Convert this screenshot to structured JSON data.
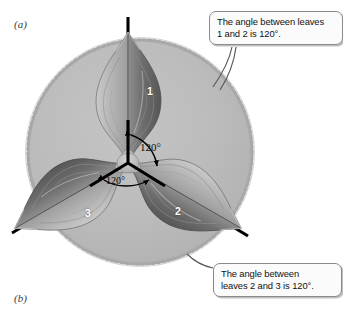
{
  "figure": {
    "panel_a_label": "(a)",
    "panel_b_label": "(b)",
    "background_color": "#ffffff"
  },
  "diagram": {
    "disc_color": "#b8b8b8",
    "axis_color": "#000000",
    "center": {
      "x": 128,
      "y": 163
    },
    "axes": [
      {
        "name": "axis-up",
        "angle_deg": 90,
        "end_x": 128,
        "end_y": 17
      },
      {
        "name": "axis-lower-right",
        "angle_deg": -30,
        "end_x": 248,
        "end_y": 236
      },
      {
        "name": "axis-lower-left",
        "angle_deg": 210,
        "end_x": 12,
        "end_y": 233
      }
    ],
    "leaves": [
      {
        "number": "1",
        "rotation_deg": 0,
        "label_x": 147,
        "label_y": 85
      },
      {
        "number": "2",
        "rotation_deg": 120,
        "label_x": 175,
        "label_y": 205
      },
      {
        "number": "3",
        "rotation_deg": 240,
        "label_x": 85,
        "label_y": 207
      }
    ],
    "angle_annotations": [
      {
        "name": "angle-1-2",
        "value": "120°",
        "x": 140,
        "y": 141
      },
      {
        "name": "angle-2-3",
        "value": "120°",
        "x": 106,
        "y": 175
      }
    ]
  },
  "callouts": {
    "top": {
      "text": "The angle between leaves\n1 and 2 is 120°."
    },
    "bottom": {
      "text": "The angle between\nleaves 2 and 3 is 120°."
    }
  }
}
